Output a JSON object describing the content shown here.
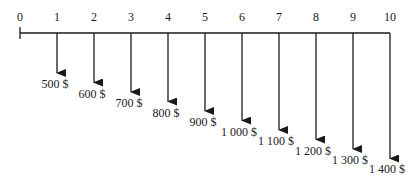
{
  "diagram": {
    "type": "cash-flow-timeline",
    "periods": [
      "0",
      "1",
      "2",
      "3",
      "4",
      "5",
      "6",
      "7",
      "8",
      "9",
      "10"
    ],
    "cash_flows": [
      {
        "period": "1",
        "amount": "500 $"
      },
      {
        "period": "2",
        "amount": "600 $"
      },
      {
        "period": "3",
        "amount": "700 $"
      },
      {
        "period": "4",
        "amount": "800 $"
      },
      {
        "period": "5",
        "amount": "900 $"
      },
      {
        "period": "6",
        "amount": "1 000 $"
      },
      {
        "period": "7",
        "amount": "1 100 $"
      },
      {
        "period": "8",
        "amount": "1 200 $"
      },
      {
        "period": "9",
        "amount": "1 300 $"
      },
      {
        "period": "10",
        "amount": "1 400 $"
      }
    ],
    "direction": "outflow (arrows pointing down)",
    "line_color": "#1a1a1a"
  }
}
